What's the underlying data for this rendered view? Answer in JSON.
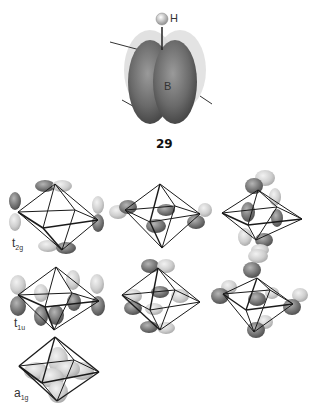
{
  "figure_29": {
    "atom_top": "H",
    "atom_center": "B",
    "number": "29"
  },
  "orbital_sets": [
    {
      "label_main": "t",
      "label_sub": "2g",
      "count": 3
    },
    {
      "label_main": "t",
      "label_sub": "1u",
      "count": 3
    },
    {
      "label_main": "a",
      "label_sub": "1g",
      "count": 1
    }
  ],
  "colors": {
    "lobe_dark": "#6e6e6e",
    "lobe_light": "#c8c8c8",
    "edge": "#1a1a1a",
    "background": "#ffffff"
  }
}
